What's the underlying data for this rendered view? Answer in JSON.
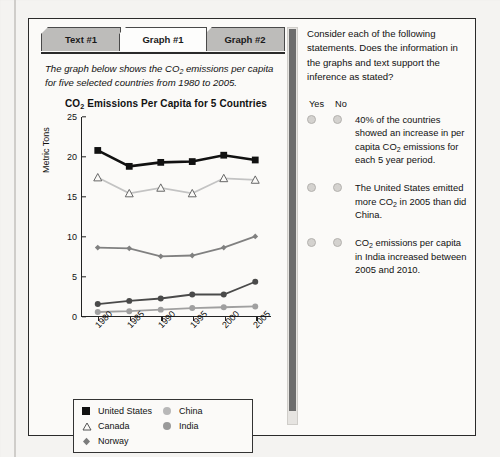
{
  "tabs": [
    {
      "label": "Text #1",
      "active": false
    },
    {
      "label": "Graph #1",
      "active": true
    },
    {
      "label": "Graph #2",
      "active": false
    }
  ],
  "intro": {
    "line1_a": "The graph below shows the CO",
    "line1_sub": "2",
    "line1_b": " emissions per capita for five selected countries from 1980 to 2005."
  },
  "chart_data": {
    "type": "line",
    "title_a": "CO",
    "title_sub": "2",
    "title_b": " Emissions Per Capita for 5 Countries",
    "title": "CO2 Emissions Per Capita for 5 Countries",
    "xlabel": "",
    "ylabel": "Metric Tons",
    "categories": [
      "1980",
      "1985",
      "1990",
      "1995",
      "2000",
      "2005"
    ],
    "ylim": [
      0,
      25
    ],
    "yticks": [
      0,
      5,
      10,
      15,
      20,
      25
    ],
    "grid": false,
    "legend_position": "bottom",
    "series": [
      {
        "name": "United States",
        "marker": "filled-square",
        "color": "#111111",
        "values": [
          20.8,
          18.8,
          19.3,
          19.4,
          20.2,
          19.6
        ]
      },
      {
        "name": "Canada",
        "marker": "open-triangle",
        "color": "#c3c3c3",
        "values": [
          17.4,
          15.4,
          16.1,
          15.4,
          17.3,
          17.1
        ]
      },
      {
        "name": "Norway",
        "marker": "diamond",
        "color": "#808080",
        "values": [
          8.6,
          8.5,
          7.5,
          7.6,
          8.6,
          10.0
        ]
      },
      {
        "name": "China",
        "marker": "filled-circle",
        "color": "#4a4a4a",
        "values": [
          1.5,
          1.9,
          2.2,
          2.7,
          2.7,
          4.3
        ]
      },
      {
        "name": "India",
        "marker": "filled-circle",
        "color": "#a0a0a0",
        "values": [
          0.5,
          0.6,
          0.8,
          1.0,
          1.1,
          1.2
        ]
      }
    ]
  },
  "legend": {
    "items": [
      {
        "label": "United States",
        "marker": "filled-square",
        "color": "#111111"
      },
      {
        "label": "China",
        "marker": "filled-circle",
        "color": "#b8b8b8"
      },
      {
        "label": "Canada",
        "marker": "open-triangle",
        "color": "#555555"
      },
      {
        "label": "India",
        "marker": "filled-circle",
        "color": "#9a9a9a"
      },
      {
        "label": "Norway",
        "marker": "diamond",
        "color": "#7c7c7c"
      }
    ]
  },
  "question_panel": {
    "prompt": "Consider each of the following statements. Does the information in the graphs and text support the inference as stated?",
    "yes_label": "Yes",
    "no_label": "No",
    "statements": [
      {
        "text_a": "40% of the countries showed an increase in per capita CO",
        "sub": "2",
        "text_b": " emissions for each 5 year period.",
        "selected": null
      },
      {
        "text_a": "The United States emitted more CO",
        "sub": "2",
        "text_b": " in 2005 than did China.",
        "selected": null
      },
      {
        "text_a": "CO",
        "sub": "2",
        "text_b": " emissions per capita in India increased between 2005 and 2010.",
        "selected": null
      }
    ]
  },
  "colors": {
    "frame": "#2a2a2a",
    "page_bg": "#f4f3f1",
    "panel_bg": "#fbfaf8",
    "tab_inactive": "#bdbcba",
    "tab_active": "#fdfdfc",
    "scrollbar_thumb": "#6d6d6d"
  }
}
